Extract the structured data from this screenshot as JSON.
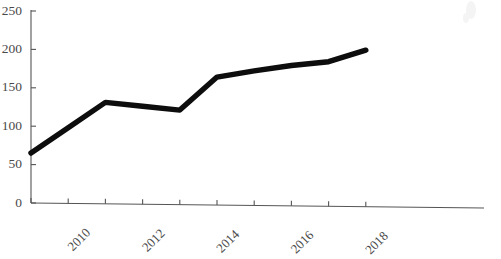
{
  "chart_data": {
    "type": "line",
    "title": "",
    "subtitle": "",
    "xlabel": "",
    "ylabel": "",
    "x": [
      2009,
      2010,
      2011,
      2012,
      2013,
      2014,
      2015,
      2016,
      2017,
      2018
    ],
    "values": [
      65,
      98,
      131,
      126,
      121,
      164,
      172,
      179,
      184,
      199
    ],
    "series": [
      {
        "name": "",
        "values": [
          65,
          98,
          131,
          126,
          121,
          164,
          172,
          179,
          184,
          199
        ]
      }
    ],
    "xlim": [
      2008.5,
      2018.5
    ],
    "ylim": [
      0,
      250
    ],
    "y_ticks": [
      0,
      50,
      100,
      150,
      200,
      250
    ],
    "y_tick_labels": [
      "0",
      "50",
      "100",
      "150",
      "200",
      "250"
    ],
    "x_ticks": [
      2009,
      2010,
      2011,
      2012,
      2013,
      2014,
      2015,
      2016,
      2017,
      2018
    ],
    "x_tick_labels": [
      "",
      "2010",
      "",
      "2012",
      "",
      "2014",
      "",
      "2016",
      "",
      "2018"
    ],
    "x_label_rotation": 45,
    "grid": false,
    "legend": false,
    "legend_position": "none",
    "line_color": "#0d0d0d",
    "axis_color": "#555555",
    "tick_label_color": "#4a4a4a",
    "background_color": "#ffffff",
    "annotations": []
  },
  "geometry": {
    "plot_left": 31,
    "plot_right": 484,
    "y_zero_px": 203,
    "y_top_px": 11,
    "y_top_value": 250,
    "x_first_px": 31,
    "x_step_px": 37.2,
    "axis_tilt_px": 5
  }
}
